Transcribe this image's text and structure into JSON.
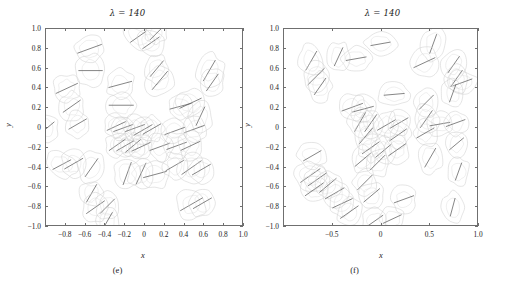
{
  "figure": {
    "background": "#ffffff",
    "contour_color": "#cfcfcf",
    "marker_color": "#5d5d5d",
    "axis_color": "#6f6f6f"
  },
  "chart_data": [
    {
      "type": "scatter",
      "panel": "(e)",
      "title": "λ = 140",
      "xlabel": "x",
      "ylabel": "y",
      "xlim": [
        -1.0,
        1.0
      ],
      "ylim": [
        -1.0,
        1.0
      ],
      "grid": false,
      "legend": null,
      "xticks": [
        -0.8,
        -0.6,
        -0.4,
        -0.2,
        0,
        0.2,
        0.4,
        0.6,
        0.8,
        1.0
      ],
      "xticklabels": [
        "−0.8",
        "−0.6",
        "−0.4",
        "−0.2",
        "0",
        "0.2",
        "0.4",
        "0.6",
        "0.8",
        "1.0"
      ],
      "yticks": [
        -1.0,
        -0.8,
        -0.6,
        -0.4,
        -0.2,
        0,
        0.2,
        0.4,
        0.6,
        0.8,
        1.0
      ],
      "yticklabels": [
        "−1.0",
        "−0.8",
        "−0.6",
        "−0.4",
        "−0.2",
        "0",
        "0.2",
        "0.4",
        "0.6",
        "0.8",
        "1.0"
      ],
      "description": "Scattered closed contour blobs each enclosing a short line-segment dipole marker",
      "blobs": [
        {
          "x": -0.56,
          "y": 0.8,
          "rx": 0.075,
          "ry": 0.075,
          "rot": 10,
          "ang": 20
        },
        {
          "x": -0.55,
          "y": 0.58,
          "rx": 0.07,
          "ry": 0.085,
          "rot": -10,
          "ang": 0
        },
        {
          "x": -0.79,
          "y": 0.4,
          "rx": 0.07,
          "ry": 0.07,
          "rot": 30,
          "ang": 25
        },
        {
          "x": -0.74,
          "y": 0.22,
          "rx": 0.062,
          "ry": 0.072,
          "rot": 0,
          "ang": 35
        },
        {
          "x": -0.68,
          "y": 0.04,
          "rx": 0.06,
          "ry": 0.068,
          "rot": 0,
          "ang": 30
        },
        {
          "x": -0.99,
          "y": 0.0,
          "rx": 0.055,
          "ry": 0.07,
          "rot": 0,
          "ang": 40
        },
        {
          "x": -0.84,
          "y": -0.37,
          "rx": 0.085,
          "ry": 0.06,
          "rot": 25,
          "ang": 28
        },
        {
          "x": -0.72,
          "y": -0.36,
          "rx": 0.062,
          "ry": 0.07,
          "rot": 0,
          "ang": 30
        },
        {
          "x": -0.54,
          "y": -0.4,
          "rx": 0.065,
          "ry": 0.085,
          "rot": 15,
          "ang": 55
        },
        {
          "x": -0.54,
          "y": -0.66,
          "rx": 0.06,
          "ry": 0.065,
          "rot": 0,
          "ang": 60
        },
        {
          "x": -0.5,
          "y": -0.8,
          "rx": 0.065,
          "ry": 0.075,
          "rot": 0,
          "ang": 35
        },
        {
          "x": -0.38,
          "y": -0.79,
          "rx": 0.06,
          "ry": 0.07,
          "rot": 0,
          "ang": 45
        },
        {
          "x": -0.38,
          "y": -0.94,
          "rx": 0.058,
          "ry": 0.065,
          "rot": 0,
          "ang": 60
        },
        {
          "x": -0.25,
          "y": 0.44,
          "rx": 0.07,
          "ry": 0.075,
          "rot": 0,
          "ang": 15
        },
        {
          "x": -0.24,
          "y": 0.23,
          "rx": 0.072,
          "ry": 0.072,
          "rot": 0,
          "ang": 0
        },
        {
          "x": -0.29,
          "y": 0.02,
          "rx": 0.06,
          "ry": 0.06,
          "rot": 0,
          "ang": 25
        },
        {
          "x": -0.22,
          "y": 0.0,
          "rx": 0.06,
          "ry": 0.062,
          "rot": 0,
          "ang": 20
        },
        {
          "x": -0.28,
          "y": -0.17,
          "rx": 0.058,
          "ry": 0.06,
          "rot": 0,
          "ang": 35
        },
        {
          "x": -0.2,
          "y": -0.18,
          "rx": 0.058,
          "ry": 0.06,
          "rot": 0,
          "ang": 30
        },
        {
          "x": -0.12,
          "y": -0.18,
          "rx": 0.058,
          "ry": 0.06,
          "rot": 0,
          "ang": 40
        },
        {
          "x": -0.1,
          "y": 0.0,
          "rx": 0.06,
          "ry": 0.062,
          "rot": 0,
          "ang": 20
        },
        {
          "x": -0.02,
          "y": -0.02,
          "rx": 0.062,
          "ry": 0.068,
          "rot": 0,
          "ang": 30
        },
        {
          "x": -0.04,
          "y": -0.19,
          "rx": 0.06,
          "ry": 0.062,
          "rot": 0,
          "ang": 25
        },
        {
          "x": -0.18,
          "y": -0.46,
          "rx": 0.07,
          "ry": 0.075,
          "rot": 0,
          "ang": 70
        },
        {
          "x": -0.04,
          "y": -0.46,
          "rx": 0.068,
          "ry": 0.072,
          "rot": 0,
          "ang": 65
        },
        {
          "x": 0.1,
          "y": -0.47,
          "rx": 0.075,
          "ry": 0.07,
          "rot": 0,
          "ang": 15
        },
        {
          "x": -0.07,
          "y": 0.92,
          "rx": 0.085,
          "ry": 0.055,
          "rot": 35,
          "ang": 35
        },
        {
          "x": 0.06,
          "y": 0.86,
          "rx": 0.08,
          "ry": 0.06,
          "rot": 30,
          "ang": 35
        },
        {
          "x": 0.11,
          "y": 0.95,
          "rx": 0.055,
          "ry": 0.05,
          "rot": 0,
          "ang": 45
        },
        {
          "x": 0.12,
          "y": 0.6,
          "rx": 0.06,
          "ry": 0.075,
          "rot": 0,
          "ang": 50
        },
        {
          "x": 0.15,
          "y": 0.48,
          "rx": 0.07,
          "ry": 0.08,
          "rot": 20,
          "ang": 50
        },
        {
          "x": 0.07,
          "y": -0.01,
          "rx": 0.06,
          "ry": 0.068,
          "rot": 0,
          "ang": 30
        },
        {
          "x": 0.15,
          "y": -0.19,
          "rx": 0.062,
          "ry": 0.068,
          "rot": 0,
          "ang": 20
        },
        {
          "x": 0.36,
          "y": 0.22,
          "rx": 0.065,
          "ry": 0.065,
          "rot": 0,
          "ang": 15
        },
        {
          "x": 0.46,
          "y": 0.25,
          "rx": 0.075,
          "ry": 0.07,
          "rot": 15,
          "ang": 25
        },
        {
          "x": 0.56,
          "y": 0.12,
          "rx": 0.06,
          "ry": 0.08,
          "rot": 0,
          "ang": 65
        },
        {
          "x": 0.5,
          "y": -0.01,
          "rx": 0.062,
          "ry": 0.07,
          "rot": 0,
          "ang": 20
        },
        {
          "x": 0.3,
          "y": -0.03,
          "rx": 0.062,
          "ry": 0.062,
          "rot": 0,
          "ang": 20
        },
        {
          "x": 0.32,
          "y": -0.18,
          "rx": 0.062,
          "ry": 0.068,
          "rot": 0,
          "ang": 20
        },
        {
          "x": 0.46,
          "y": -0.18,
          "rx": 0.062,
          "ry": 0.07,
          "rot": 0,
          "ang": 25
        },
        {
          "x": 0.3,
          "y": -0.38,
          "rx": 0.06,
          "ry": 0.068,
          "rot": 0,
          "ang": 30
        },
        {
          "x": 0.47,
          "y": -0.4,
          "rx": 0.07,
          "ry": 0.08,
          "rot": 15,
          "ang": 35
        },
        {
          "x": 0.57,
          "y": -0.42,
          "rx": 0.062,
          "ry": 0.068,
          "rot": 0,
          "ang": 30
        },
        {
          "x": 0.47,
          "y": -0.77,
          "rx": 0.075,
          "ry": 0.075,
          "rot": 0,
          "ang": 30
        },
        {
          "x": 0.58,
          "y": -0.76,
          "rx": 0.062,
          "ry": 0.07,
          "rot": 0,
          "ang": 30
        },
        {
          "x": 0.65,
          "y": 0.58,
          "rx": 0.07,
          "ry": 0.085,
          "rot": 10,
          "ang": 60
        },
        {
          "x": 0.68,
          "y": 0.46,
          "rx": 0.06,
          "ry": 0.075,
          "rot": 0,
          "ang": 55
        }
      ]
    },
    {
      "type": "scatter",
      "panel": "(f)",
      "title": "λ = 140",
      "xlabel": "x",
      "ylabel": "y",
      "xlim": [
        -1.0,
        1.0
      ],
      "ylim": [
        -1.0,
        1.0
      ],
      "grid": false,
      "legend": null,
      "xticks": [
        -0.5,
        0,
        0.5,
        1.0
      ],
      "xticklabels": [
        "−0.5",
        "0",
        "0.5",
        "1.0"
      ],
      "yticks": [
        -1.0,
        -0.8,
        -0.6,
        -0.4,
        -0.2,
        0,
        0.2,
        0.4,
        0.6,
        0.8,
        1.0
      ],
      "yticklabels": [
        "−1.0",
        "−0.8",
        "−0.6",
        "−0.4",
        "−0.2",
        "0",
        "0.2",
        "0.4",
        "0.6",
        "0.8",
        "1.0"
      ],
      "description": "Scattered closed contour blobs each enclosing a short line-segment dipole marker, denser than panel (e)",
      "blobs": [
        {
          "x": -0.72,
          "y": 0.68,
          "rx": 0.065,
          "ry": 0.085,
          "rot": -20,
          "ang": 60
        },
        {
          "x": -0.67,
          "y": 0.52,
          "rx": 0.07,
          "ry": 0.075,
          "rot": -15,
          "ang": 45
        },
        {
          "x": -0.63,
          "y": 0.42,
          "rx": 0.06,
          "ry": 0.075,
          "rot": 0,
          "ang": 55
        },
        {
          "x": -0.44,
          "y": 0.72,
          "rx": 0.06,
          "ry": 0.075,
          "rot": 0,
          "ang": 65
        },
        {
          "x": -0.26,
          "y": 0.7,
          "rx": 0.08,
          "ry": 0.06,
          "rot": 0,
          "ang": 10
        },
        {
          "x": -0.01,
          "y": 0.85,
          "rx": 0.08,
          "ry": 0.058,
          "rot": 5,
          "ang": 10
        },
        {
          "x": 0.53,
          "y": 0.85,
          "rx": 0.06,
          "ry": 0.085,
          "rot": 10,
          "ang": 70
        },
        {
          "x": 0.44,
          "y": 0.66,
          "rx": 0.07,
          "ry": 0.075,
          "rot": 0,
          "ang": 25
        },
        {
          "x": 0.74,
          "y": 0.64,
          "rx": 0.06,
          "ry": 0.08,
          "rot": 15,
          "ang": 55
        },
        {
          "x": 0.77,
          "y": 0.5,
          "rx": 0.06,
          "ry": 0.075,
          "rot": 0,
          "ang": 55
        },
        {
          "x": 0.83,
          "y": 0.46,
          "rx": 0.075,
          "ry": 0.06,
          "rot": 10,
          "ang": 20
        },
        {
          "x": 0.73,
          "y": 0.35,
          "rx": 0.055,
          "ry": 0.07,
          "rot": 0,
          "ang": 70
        },
        {
          "x": 0.13,
          "y": 0.34,
          "rx": 0.08,
          "ry": 0.06,
          "rot": 0,
          "ang": 5
        },
        {
          "x": -0.3,
          "y": 0.21,
          "rx": 0.075,
          "ry": 0.065,
          "rot": 10,
          "ang": 20
        },
        {
          "x": -0.19,
          "y": 0.19,
          "rx": 0.065,
          "ry": 0.07,
          "rot": 0,
          "ang": 15
        },
        {
          "x": -0.22,
          "y": 0.06,
          "rx": 0.065,
          "ry": 0.072,
          "rot": 0,
          "ang": 60
        },
        {
          "x": -0.11,
          "y": 0.05,
          "rx": 0.062,
          "ry": 0.07,
          "rot": 0,
          "ang": 55
        },
        {
          "x": -0.16,
          "y": -0.08,
          "rx": 0.062,
          "ry": 0.07,
          "rot": 0,
          "ang": 50
        },
        {
          "x": 0.05,
          "y": 0.03,
          "rx": 0.062,
          "ry": 0.068,
          "rot": 0,
          "ang": 30
        },
        {
          "x": 0.18,
          "y": 0.05,
          "rx": 0.062,
          "ry": 0.068,
          "rot": 0,
          "ang": 30
        },
        {
          "x": 0.17,
          "y": -0.07,
          "rx": 0.062,
          "ry": 0.068,
          "rot": 0,
          "ang": 35
        },
        {
          "x": 0.46,
          "y": 0.09,
          "rx": 0.062,
          "ry": 0.075,
          "rot": 0,
          "ang": 55
        },
        {
          "x": 0.45,
          "y": -0.05,
          "rx": 0.06,
          "ry": 0.07,
          "rot": 0,
          "ang": 30
        },
        {
          "x": 0.6,
          "y": 0.04,
          "rx": 0.07,
          "ry": 0.06,
          "rot": 0,
          "ang": 10
        },
        {
          "x": 0.76,
          "y": 0.05,
          "rx": 0.06,
          "ry": 0.062,
          "rot": 0,
          "ang": 20
        },
        {
          "x": 0.46,
          "y": 0.26,
          "rx": 0.06,
          "ry": 0.072,
          "rot": 0,
          "ang": 45
        },
        {
          "x": -0.11,
          "y": -0.2,
          "rx": 0.062,
          "ry": 0.068,
          "rot": 0,
          "ang": 35
        },
        {
          "x": 0.02,
          "y": -0.23,
          "rx": 0.06,
          "ry": 0.068,
          "rot": 0,
          "ang": 40
        },
        {
          "x": 0.16,
          "y": -0.22,
          "rx": 0.062,
          "ry": 0.068,
          "rot": 0,
          "ang": 35
        },
        {
          "x": -0.19,
          "y": -0.32,
          "rx": 0.062,
          "ry": 0.068,
          "rot": 0,
          "ang": 40
        },
        {
          "x": -0.04,
          "y": -0.35,
          "rx": 0.062,
          "ry": 0.07,
          "rot": 0,
          "ang": 45
        },
        {
          "x": 0.5,
          "y": -0.3,
          "rx": 0.065,
          "ry": 0.08,
          "rot": 0,
          "ang": 60
        },
        {
          "x": -0.71,
          "y": -0.28,
          "rx": 0.075,
          "ry": 0.06,
          "rot": 25,
          "ang": 30
        },
        {
          "x": -0.73,
          "y": -0.48,
          "rx": 0.085,
          "ry": 0.07,
          "rot": 30,
          "ang": 35
        },
        {
          "x": -0.66,
          "y": -0.52,
          "rx": 0.07,
          "ry": 0.065,
          "rot": 25,
          "ang": 35
        },
        {
          "x": -0.69,
          "y": -0.62,
          "rx": 0.07,
          "ry": 0.065,
          "rot": 25,
          "ang": 35
        },
        {
          "x": -0.55,
          "y": -0.58,
          "rx": 0.065,
          "ry": 0.07,
          "rot": 0,
          "ang": 40
        },
        {
          "x": -0.48,
          "y": -0.66,
          "rx": 0.065,
          "ry": 0.072,
          "rot": 0,
          "ang": 30
        },
        {
          "x": -0.4,
          "y": -0.76,
          "rx": 0.065,
          "ry": 0.07,
          "rot": 0,
          "ang": 25
        },
        {
          "x": -0.33,
          "y": -0.85,
          "rx": 0.065,
          "ry": 0.07,
          "rot": 0,
          "ang": 35
        },
        {
          "x": -0.17,
          "y": -0.55,
          "rx": 0.062,
          "ry": 0.07,
          "rot": 0,
          "ang": 45
        },
        {
          "x": -0.1,
          "y": -0.68,
          "rx": 0.062,
          "ry": 0.068,
          "rot": 0,
          "ang": 40
        },
        {
          "x": -0.07,
          "y": -0.94,
          "rx": 0.06,
          "ry": 0.065,
          "rot": 0,
          "ang": 35
        },
        {
          "x": 0.11,
          "y": -0.92,
          "rx": 0.06,
          "ry": 0.065,
          "rot": 0,
          "ang": 25
        },
        {
          "x": 0.23,
          "y": -0.72,
          "rx": 0.062,
          "ry": 0.068,
          "rot": 0,
          "ang": 20
        },
        {
          "x": 0.79,
          "y": -0.44,
          "rx": 0.055,
          "ry": 0.075,
          "rot": 0,
          "ang": 70
        },
        {
          "x": 0.73,
          "y": -0.8,
          "rx": 0.055,
          "ry": 0.08,
          "rot": 0,
          "ang": 75
        },
        {
          "x": 0.77,
          "y": -0.16,
          "rx": 0.055,
          "ry": 0.065,
          "rot": 0,
          "ang": 40
        }
      ]
    }
  ]
}
